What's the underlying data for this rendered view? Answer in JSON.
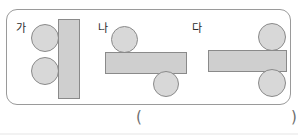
{
  "page": {
    "kind": "worksheet-figure",
    "width": 298,
    "height": 135,
    "background_color": "#ffffff"
  },
  "frame": {
    "label": "figure-frame",
    "border_color": "#9a9a9a",
    "corner_radius": "11px"
  },
  "colors": {
    "shape_fill": "#d4d4d4",
    "circle_fill": "#d8d8d8",
    "rect_fill": "#cfcfcf",
    "shape_stroke": "#8a8a8a",
    "text": "#2b2b2b",
    "paren": "#6d6d6d"
  },
  "groups": [
    {
      "id": "ga",
      "label": "가",
      "description": "vertical bar with two circles stacked at its left side",
      "shapes": [
        {
          "kind": "circle",
          "name": "circle-top-left",
          "x": 30,
          "y": 24,
          "w": 28,
          "h": 28
        },
        {
          "kind": "circle",
          "name": "circle-bottom-left",
          "x": 30,
          "y": 57,
          "w": 28,
          "h": 28
        },
        {
          "kind": "rect",
          "name": "vertical-bar",
          "x": 57,
          "y": 19,
          "w": 22,
          "h": 80
        }
      ]
    },
    {
      "id": "na",
      "label": "나",
      "description": "horizontal bar with one circle above at the left and one circle below at the right",
      "shapes": [
        {
          "kind": "circle",
          "name": "circle-above-left",
          "x": 110,
          "y": 26,
          "w": 27,
          "h": 27
        },
        {
          "kind": "rect",
          "name": "horizontal-bar",
          "x": 104,
          "y": 52,
          "w": 82,
          "h": 22
        },
        {
          "kind": "circle",
          "name": "circle-below-right",
          "x": 152,
          "y": 71,
          "w": 26,
          "h": 26
        }
      ]
    },
    {
      "id": "da",
      "label": "다",
      "description": "horizontal bar with one circle above and one circle below, both at the right end",
      "shapes": [
        {
          "kind": "circle",
          "name": "circle-above-right",
          "x": 257,
          "y": 23,
          "w": 28,
          "h": 28
        },
        {
          "kind": "rect",
          "name": "horizontal-bar",
          "x": 207,
          "y": 50,
          "w": 79,
          "h": 22
        },
        {
          "kind": "circle",
          "name": "circle-below-right",
          "x": 257,
          "y": 69,
          "w": 28,
          "h": 28
        }
      ]
    }
  ],
  "labels": {
    "ga": {
      "text": "가",
      "x": 15,
      "y": 22
    },
    "na": {
      "text": "나",
      "x": 97,
      "y": 22
    },
    "da": {
      "text": "다",
      "x": 191,
      "y": 22
    }
  },
  "answer": {
    "open_paren": "(",
    "close_paren": ")",
    "value": ""
  }
}
